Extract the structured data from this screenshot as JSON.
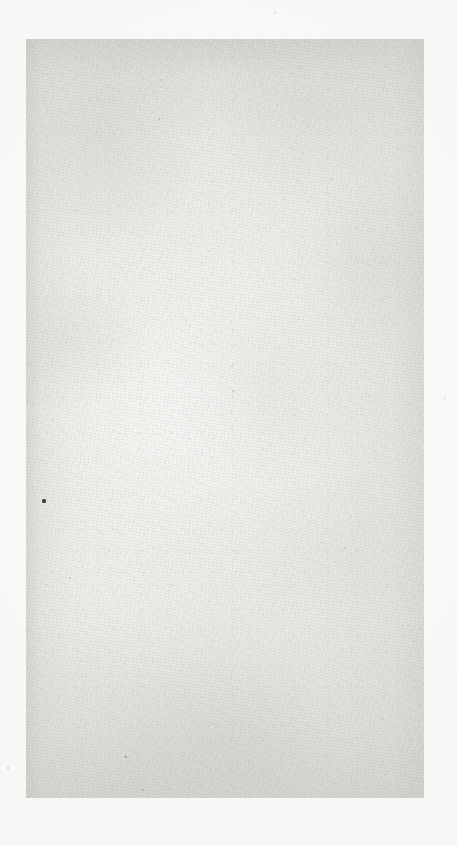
{
  "document": {
    "kind": "scanned-page",
    "description": "Blank scanned page",
    "canvas": {
      "width": 457,
      "height": 845,
      "background_color": "#fbfbfa"
    },
    "sheet": {
      "left": 26,
      "top": 39,
      "width": 398,
      "height": 759,
      "base_color": "#e7e7e4",
      "edge_shadow_color": "#c4c4c0",
      "center_highlight_color": "#f5f5f3"
    },
    "visible_text": "",
    "text_blocks": [],
    "specks": [
      {
        "name": "speck-left-mid",
        "x": 44,
        "y": 501,
        "size": 3.2,
        "color": "#2e2e2c",
        "opacity": 0.92
      },
      {
        "name": "speck-margin-lower",
        "x": 8,
        "y": 768,
        "size": 2.4,
        "color": "#9a9a98",
        "opacity": 0.55
      },
      {
        "name": "speck-margin-top",
        "x": 275,
        "y": 13,
        "size": 2.0,
        "color": "#b3b3b1",
        "opacity": 0.45
      },
      {
        "name": "speck-margin-right",
        "x": 445,
        "y": 398,
        "size": 2.0,
        "color": "#b8b8b6",
        "opacity": 0.4
      },
      {
        "name": "speck-lower-left",
        "x": 126,
        "y": 757,
        "size": 2.1,
        "color": "#6b6b69",
        "opacity": 0.6
      },
      {
        "name": "speck-lower-mid",
        "x": 143,
        "y": 790,
        "size": 1.8,
        "color": "#8a8a88",
        "opacity": 0.5
      },
      {
        "name": "speck-upper-left",
        "x": 159,
        "y": 119,
        "size": 1.9,
        "color": "#8f8f8d",
        "opacity": 0.48
      },
      {
        "name": "speck-upper-right",
        "x": 331,
        "y": 179,
        "size": 1.8,
        "color": "#939391",
        "opacity": 0.45
      },
      {
        "name": "speck-center",
        "x": 233,
        "y": 391,
        "size": 1.7,
        "color": "#969694",
        "opacity": 0.42
      },
      {
        "name": "speck-right-mid",
        "x": 345,
        "y": 548,
        "size": 1.7,
        "color": "#9a9a98",
        "opacity": 0.4
      },
      {
        "name": "speck-left-low",
        "x": 70,
        "y": 578,
        "size": 1.8,
        "color": "#949492",
        "opacity": 0.44
      },
      {
        "name": "speck-top-band",
        "x": 161,
        "y": 80,
        "size": 1.6,
        "color": "#989896",
        "opacity": 0.4
      }
    ]
  }
}
